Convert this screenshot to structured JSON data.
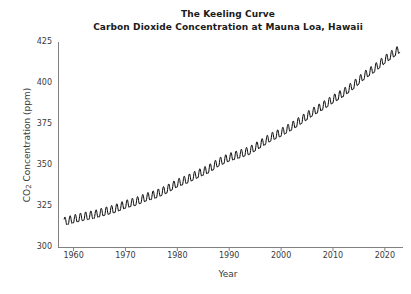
{
  "figure": {
    "title_line1": "The Keeling Curve",
    "title_line2": "Carbon Dioxide Concentration at Mauna Loa, Hawaii",
    "background_color": "#ffffff",
    "line_color": "#000000",
    "axis_color": "#808080",
    "text_color": "#3a3a3a"
  },
  "axes": {
    "xlabel": "Year",
    "ylabel_prefix": "CO",
    "ylabel_sub": "2",
    "ylabel_suffix": " Concentration (ppm)",
    "ylabel_full": "CO2 Concentration (ppm)",
    "yticks": [
      "300",
      "325",
      "350",
      "375",
      "400",
      "425"
    ],
    "xticks": [
      "1960",
      "1970",
      "1980",
      "1990",
      "2000",
      "2010",
      "2020"
    ]
  },
  "chart_data": {
    "type": "line",
    "xlabel": "Year",
    "ylabel": "CO2 Concentration (ppm)",
    "xlim": [
      1957.0,
      2023.5
    ],
    "ylim": [
      300,
      425
    ],
    "xticks": [
      1960,
      1970,
      1980,
      1990,
      2000,
      2010,
      2020
    ],
    "yticks": [
      300,
      325,
      350,
      375,
      400,
      425
    ],
    "grid": false,
    "legend": null,
    "series_name": "Monthly mean CO2 (Mauna Loa)",
    "seasonal_amplitude_ppm": 3.0,
    "seasonal_peak_month": 5,
    "annual_trend_x": [
      1958,
      1960,
      1962,
      1964,
      1966,
      1968,
      1970,
      1972,
      1974,
      1976,
      1978,
      1980,
      1982,
      1984,
      1986,
      1988,
      1990,
      1992,
      1994,
      1996,
      1998,
      2000,
      2002,
      2004,
      2006,
      2008,
      2010,
      2012,
      2014,
      2016,
      2018,
      2020,
      2022
    ],
    "annual_trend_y": [
      315.0,
      316.6,
      318.2,
      319.4,
      321.2,
      322.9,
      325.5,
      327.3,
      329.9,
      331.9,
      334.8,
      338.5,
      341.0,
      344.2,
      347.0,
      351.3,
      354.2,
      356.2,
      358.5,
      362.4,
      366.5,
      369.4,
      373.1,
      377.3,
      381.7,
      385.5,
      389.7,
      393.6,
      398.4,
      404.1,
      408.5,
      413.9,
      418.4
    ]
  }
}
